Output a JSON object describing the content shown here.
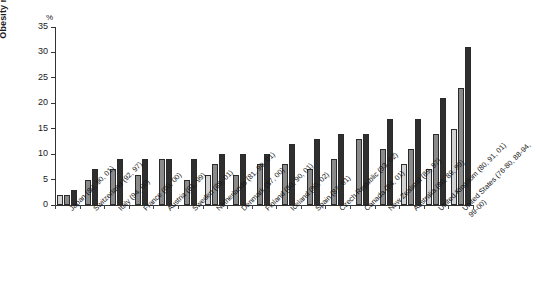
{
  "chart_data": {
    "type": "bar",
    "title": "",
    "xlabel": "",
    "ylabel": "Obesity rate",
    "unit_label": "%",
    "ylim": [
      0,
      35
    ],
    "yticks": [
      0,
      5,
      10,
      15,
      20,
      25,
      30,
      35
    ],
    "grid": false,
    "legend": "none",
    "series_colors": [
      "#d2d2d2",
      "#8a8a8a",
      "#2f2f2f"
    ],
    "note": "Each country shows successive survey years; bars ordered earliest (lightest) to latest (darkest).",
    "categories": [
      "Japan (80, 90, 01)",
      "Switzerland (92, 97)",
      "Italy (94, 00)",
      "France (90, 00)",
      "Austria (91, 99)",
      "Sweden (89, 01)",
      "Netherlands (81, 90, 01)",
      "Denmark (87, 00)",
      "Finland (80, 90, 01)",
      "Iceland (90, 02)",
      "Spain (87, 01)",
      "Czech Republic (93, 02)",
      "Canada (94, 01)",
      "New Zealand (89, 97)",
      "Australia (80, 89, 99)",
      "United Kingdom (80, 91, 01)",
      "United States (76-80, 88-94, 99-00)"
    ],
    "groups": [
      {
        "category": "Japan (80, 90, 01)",
        "values": [
          2,
          2,
          3
        ]
      },
      {
        "category": "Switzerland (92, 97)",
        "values": [
          5,
          7
        ]
      },
      {
        "category": "Italy (94, 00)",
        "values": [
          7,
          9
        ]
      },
      {
        "category": "France (90, 00)",
        "values": [
          6,
          9
        ]
      },
      {
        "category": "Austria (91, 99)",
        "values": [
          9,
          9
        ]
      },
      {
        "category": "Sweden (89, 01)",
        "values": [
          5,
          9
        ]
      },
      {
        "category": "Netherlands (81, 90, 01)",
        "values": [
          6,
          8,
          10
        ]
      },
      {
        "category": "Denmark (87, 00)",
        "values": [
          6,
          10
        ]
      },
      {
        "category": "Finland (80, 90, 01)",
        "values": [
          8,
          10
        ]
      },
      {
        "category": "Iceland (90, 02)",
        "values": [
          8,
          12
        ]
      },
      {
        "category": "Spain (87, 01)",
        "values": [
          7,
          13
        ]
      },
      {
        "category": "Czech Republic (93, 02)",
        "values": [
          9,
          14
        ]
      },
      {
        "category": "Canada (94, 01)",
        "values": [
          13,
          14
        ]
      },
      {
        "category": "New Zealand (89, 97)",
        "values": [
          11,
          17
        ]
      },
      {
        "category": "Australia (80, 89, 99)",
        "values": [
          8,
          11,
          17
        ]
      },
      {
        "category": "United Kingdom (80, 91, 01)",
        "values": [
          7,
          14,
          21
        ]
      },
      {
        "category": "United States (76-80, 88-94, 99-00)",
        "values": [
          15,
          23,
          31
        ]
      }
    ]
  }
}
